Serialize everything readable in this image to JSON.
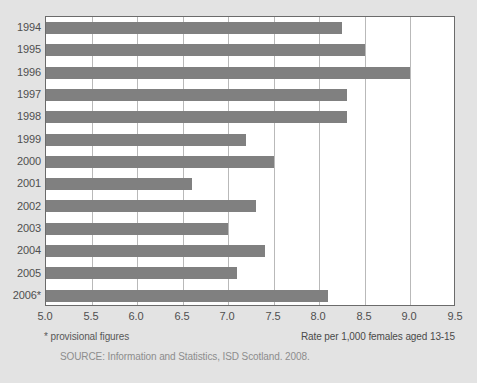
{
  "chart_data": {
    "type": "bar",
    "orientation": "horizontal",
    "title": "",
    "xlabel": "Rate per 1,000 females aged 13-15",
    "ylabel": "",
    "categories": [
      "1994",
      "1995",
      "1996",
      "1997",
      "1998",
      "1999",
      "2000",
      "2001",
      "2002",
      "2003",
      "2004",
      "2005",
      "2006*"
    ],
    "values": [
      8.25,
      8.5,
      9.0,
      8.3,
      8.3,
      7.2,
      7.5,
      6.6,
      7.3,
      7.0,
      7.4,
      7.1,
      8.1
    ],
    "xlim": [
      5.0,
      9.5
    ],
    "xticks": [
      5.0,
      5.5,
      6.0,
      6.5,
      7.0,
      7.5,
      8.0,
      8.5,
      9.0,
      9.5
    ],
    "xtick_labels": [
      "5.0",
      "5.5",
      "6.0",
      "6.5",
      "7.0",
      "7.5",
      "8.0",
      "8.5",
      "9.0",
      "9.5"
    ],
    "grid": true,
    "grid_axis": "x",
    "legend": false,
    "bar_color": "#808080",
    "plot_background": "#ffffff",
    "figure_background": "#e3e3e3",
    "gridline_color": "#b9b9b9",
    "axis_border_color": "#6b6b6b"
  },
  "footnotes": {
    "provisional": "* provisional figures",
    "source": "SOURCE: Information and Statistics, ISD Scotland. 2008."
  }
}
